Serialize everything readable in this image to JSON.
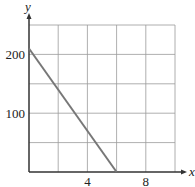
{
  "chart_data": {
    "type": "line",
    "title": "",
    "xlabel": "x",
    "ylabel": "y",
    "xlim": [
      0,
      10
    ],
    "ylim": [
      0,
      250
    ],
    "x_ticks": [
      {
        "value": 4,
        "label": "4"
      },
      {
        "value": 8,
        "label": "8"
      }
    ],
    "y_ticks": [
      {
        "value": 100,
        "label": "100"
      },
      {
        "value": 200,
        "label": "200"
      }
    ],
    "grid": {
      "on": true,
      "x_step": 2,
      "y_step": 50
    },
    "legend": null,
    "series": [
      {
        "name": "line",
        "color": "#777777",
        "points": [
          {
            "x": 0,
            "y": 210
          },
          {
            "x": 6,
            "y": 0
          }
        ]
      }
    ]
  },
  "colors": {
    "grid": "#9a9a9a",
    "axis": "#333333",
    "line": "#777777"
  }
}
